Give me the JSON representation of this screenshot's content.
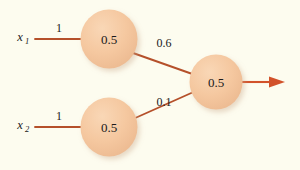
{
  "diagram": {
    "type": "neural-network",
    "background_color": "#fdfcef",
    "node_fill_color": "#f5c9a0",
    "edge_color": "#b5502a",
    "arrow_color": "#d2522a",
    "text_color": "#1a1a1a",
    "inputs": [
      {
        "id": "x1",
        "symbol": "x",
        "subscript": "1",
        "weight": "1"
      },
      {
        "id": "x2",
        "symbol": "x",
        "subscript": "2",
        "weight": "1"
      }
    ],
    "hidden_nodes": [
      {
        "id": "h1",
        "value": "0.5",
        "outgoing_weight": "0.6"
      },
      {
        "id": "h2",
        "value": "0.5",
        "outgoing_weight": "0.1"
      }
    ],
    "output_node": {
      "id": "o1",
      "value": "0.5"
    },
    "edges": [
      {
        "from": "x1",
        "to": "h1",
        "label": "1"
      },
      {
        "from": "x2",
        "to": "h2",
        "label": "1"
      },
      {
        "from": "h1",
        "to": "o1",
        "label": "0.6"
      },
      {
        "from": "h2",
        "to": "o1",
        "label": "0.1"
      },
      {
        "from": "o1",
        "to": "output",
        "label": ""
      }
    ]
  }
}
